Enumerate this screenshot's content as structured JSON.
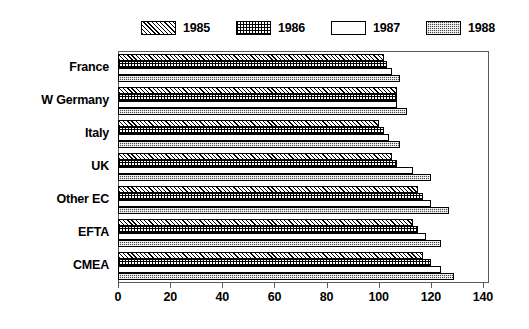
{
  "chart_data": {
    "type": "bar",
    "orientation": "horizontal",
    "title": "",
    "subtitle": "",
    "xlabel": "",
    "ylabel": "",
    "xlim": [
      0,
      140
    ],
    "xticks": [
      0,
      20,
      40,
      60,
      80,
      100,
      120,
      140
    ],
    "xtick_labels": [
      "0",
      "20",
      "40",
      "60",
      "80",
      "100",
      "120",
      "140"
    ],
    "grid": false,
    "legend_position": "top",
    "categories": [
      "France",
      "W Germany",
      "Italy",
      "UK",
      "Other EC",
      "EFTA",
      "CMEA"
    ],
    "series": [
      {
        "name": "1985",
        "pattern": "diagonal-hatch",
        "values": [
          102,
          107,
          100,
          105,
          115,
          113,
          117
        ]
      },
      {
        "name": "1986",
        "pattern": "crosshatch-grid",
        "values": [
          103,
          107,
          102,
          107,
          117,
          115,
          120
        ]
      },
      {
        "name": "1987",
        "pattern": "white-empty",
        "values": [
          105,
          107,
          104,
          113,
          120,
          118,
          124
        ]
      },
      {
        "name": "1988",
        "pattern": "dark-speckle",
        "values": [
          108,
          111,
          108,
          120,
          127,
          124,
          129
        ]
      }
    ]
  },
  "legend": {
    "entries": [
      {
        "label": "1985",
        "swatch": "diagonal-hatch-swatch"
      },
      {
        "label": "1986",
        "swatch": "crosshatch-grid-swatch"
      },
      {
        "label": "1987",
        "swatch": "white-empty-swatch"
      },
      {
        "label": "1988",
        "swatch": "dark-speckle-swatch"
      }
    ]
  },
  "colors": {
    "background": "#ffffff",
    "axis": "#5a5a5a",
    "bar_outline": "#000000",
    "dark_fill": "#4a4a4a",
    "text": "#000000"
  }
}
